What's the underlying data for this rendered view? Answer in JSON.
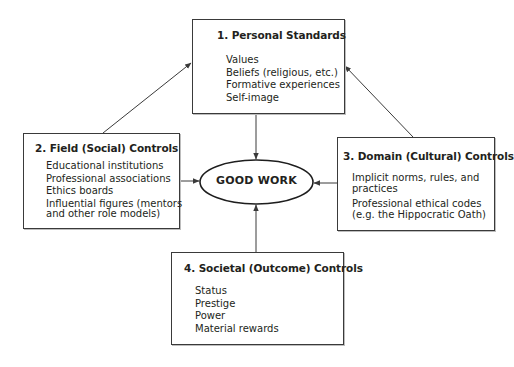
{
  "diagram": {
    "center": {
      "label": "GOOD WORK"
    },
    "boxes": [
      {
        "title": "1. Personal Standards",
        "items": [
          "Values",
          "Beliefs (religious, etc.)",
          "Formative experiences",
          "Self-image"
        ]
      },
      {
        "title": "2. Field (Social) Controls",
        "items": [
          "Educational institutions",
          "Professional associations",
          "Ethics boards",
          "Influential figures (mentors",
          "and other role models)"
        ]
      },
      {
        "title": "3. Domain (Cultural) Controls",
        "items": [
          "Implicit norms, rules, and",
          "practices",
          "Professional ethical codes",
          "(e.g. the Hippocratic Oath)"
        ]
      },
      {
        "title": "4. Societal (Outcome) Controls",
        "items": [
          "Status",
          "Prestige",
          "Power",
          "Material rewards"
        ]
      }
    ],
    "colors": {
      "line": "#3a3a3a",
      "text": "#231f20",
      "background": "#ffffff"
    }
  }
}
